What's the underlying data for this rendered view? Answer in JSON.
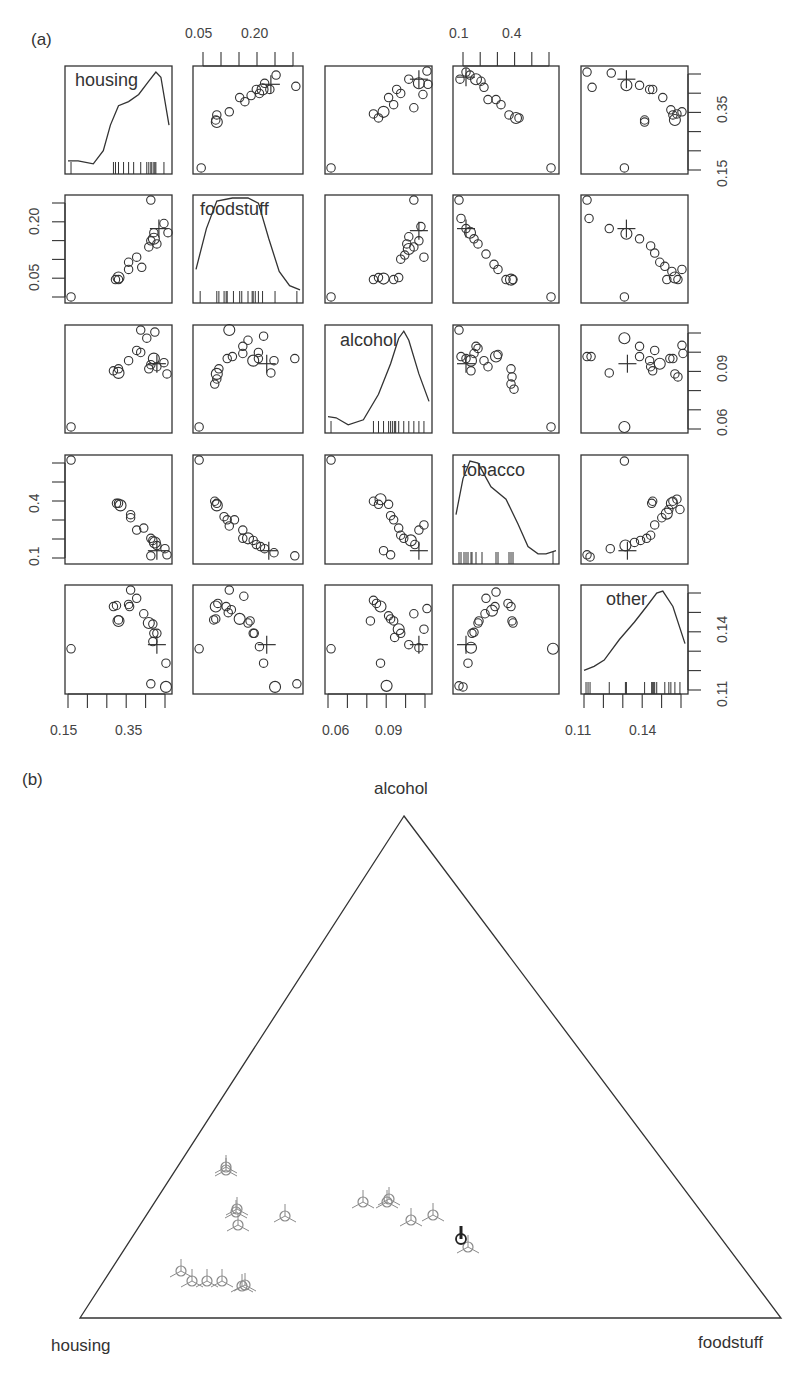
{
  "figure": {
    "panel_a_label": "(a)",
    "panel_b_label": "(b)"
  },
  "chart_data": [
    {
      "type": "scatter",
      "subtype": "scatterplot-matrix",
      "title": "(a)",
      "variables": [
        "housing",
        "foodstuff",
        "alcohol",
        "tobacco",
        "other"
      ],
      "diagonal": "kernel density with rug",
      "axis_ticks": {
        "housing": {
          "labels": [
            "0.15",
            "0.35"
          ],
          "position": "bottom"
        },
        "foodstuff": {
          "labels": [
            "0.05",
            "0.20"
          ],
          "position": "top/left"
        },
        "alcohol": {
          "labels": [
            "0.06",
            "0.09"
          ],
          "position": "bottom/right"
        },
        "tobacco": {
          "labels": [
            "0.1",
            "0.4"
          ],
          "position": "top/left"
        },
        "other": {
          "labels": [
            "0.11",
            "0.14"
          ],
          "position": "bottom/right"
        },
        "housing_right": {
          "labels": [
            "0.15",
            "0.35"
          ],
          "position": "right"
        },
        "foodstuff_left": {
          "labels": [
            "0.05",
            "0.20"
          ],
          "position": "left"
        },
        "tobacco_left": {
          "labels": [
            "0.1",
            "0.4"
          ],
          "position": "left"
        }
      },
      "points_normalized_housing_foodstuff": [
        [
          0.03,
          0.03
        ],
        [
          0.47,
          0.56
        ],
        [
          0.49,
          0.6
        ],
        [
          0.5,
          0.63
        ],
        [
          0.58,
          0.77
        ],
        [
          0.62,
          0.69
        ],
        [
          0.71,
          0.82
        ],
        [
          0.76,
          0.89
        ],
        [
          0.81,
          0.84
        ],
        [
          0.83,
          0.86
        ],
        [
          0.87,
          0.91
        ],
        [
          0.88,
          0.94
        ],
        [
          0.92,
          0.98
        ],
        [
          0.97,
          0.98
        ],
        [
          0.99,
          0.83
        ]
      ],
      "center_marker": "+",
      "notes": "Outlier point near lower-left corner in most panels; cross (+) marks the center"
    },
    {
      "type": "scatter",
      "subtype": "ternary",
      "title": "(b)",
      "vertices": {
        "top": "alcohol",
        "bottom_left": "housing",
        "bottom_right": "foodstuff"
      },
      "marker": "circle with three-armed star (gray), one highlighted dark",
      "points_pixel": [
        [
          226,
          1170
        ],
        [
          226,
          1167
        ],
        [
          237,
          1209
        ],
        [
          236,
          1212
        ],
        [
          238,
          1225
        ],
        [
          285,
          1216
        ],
        [
          181,
          1271
        ],
        [
          192,
          1281
        ],
        [
          207,
          1281
        ],
        [
          222,
          1281
        ],
        [
          242,
          1286
        ],
        [
          245,
          1285
        ],
        [
          363,
          1202
        ],
        [
          387,
          1202
        ],
        [
          389,
          1199
        ],
        [
          411,
          1220
        ],
        [
          433,
          1215
        ],
        [
          468,
          1247
        ]
      ],
      "highlighted_point_pixel": [
        461,
        1239
      ]
    }
  ],
  "matrix": {
    "diag_labels": [
      "housing",
      "foodstuff",
      "alcohol",
      "tobacco",
      "other"
    ],
    "top_ticks": [
      {
        "col": 1,
        "labels": [
          "0.05",
          "0.20"
        ]
      },
      {
        "col": 3,
        "labels": [
          "0.1",
          "0.4"
        ]
      }
    ],
    "bottom_ticks": [
      {
        "col": 0,
        "labels": [
          "0.15",
          "0.35"
        ]
      },
      {
        "col": 2,
        "labels": [
          "0.06",
          "0.09"
        ]
      },
      {
        "col": 4,
        "labels": [
          "0.11",
          "0.14"
        ]
      }
    ],
    "left_ticks": [
      {
        "row": 1,
        "labels": [
          "0.05",
          "0.20"
        ]
      },
      {
        "row": 3,
        "labels": [
          "0.1",
          "0.4"
        ]
      }
    ],
    "right_ticks": [
      {
        "row": 0,
        "labels": [
          "0.15",
          "0.35"
        ]
      },
      {
        "row": 2,
        "labels": [
          "0.06",
          "0.09"
        ]
      },
      {
        "row": 4,
        "labels": [
          "0.11",
          "0.14"
        ]
      }
    ]
  },
  "ternary": {
    "top_label": "alcohol",
    "left_label": "housing",
    "right_label": "foodstuff"
  }
}
